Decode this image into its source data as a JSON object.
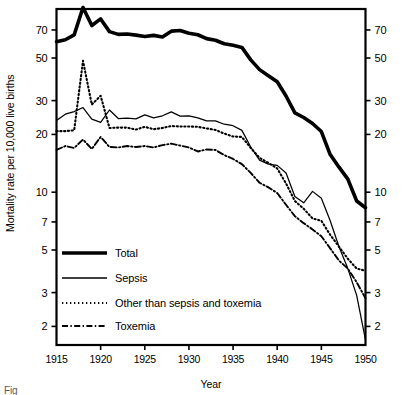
{
  "chart_data": {
    "type": "line",
    "title": "",
    "xlabel": "Year",
    "ylabel": "Mortality rate per 10,000 live births",
    "yscale": "log",
    "ylim": [
      1.6,
      90
    ],
    "xlim": [
      1915,
      1950
    ],
    "grid": false,
    "legend_position": "lower-left-inside",
    "ytick_labels": [
      "70",
      "50",
      "30",
      "20",
      "10",
      "7",
      "5",
      "3",
      "2"
    ],
    "ytick_values": [
      70,
      50,
      30,
      20,
      10,
      7,
      5,
      3,
      2
    ],
    "xtick_labels": [
      "1915",
      "1920",
      "1925",
      "1930",
      "1935",
      "1940",
      "1945",
      "1950"
    ],
    "xtick_values": [
      1915,
      1920,
      1925,
      1930,
      1935,
      1940,
      1945,
      1950
    ],
    "right_axis_labels": [
      "70",
      "50",
      "30",
      "20",
      "10",
      "7",
      "5",
      "3",
      "2"
    ],
    "x": [
      1915,
      1916,
      1917,
      1918,
      1919,
      1920,
      1921,
      1922,
      1923,
      1924,
      1925,
      1926,
      1927,
      1928,
      1929,
      1930,
      1931,
      1932,
      1933,
      1934,
      1935,
      1936,
      1937,
      1938,
      1939,
      1940,
      1941,
      1942,
      1943,
      1944,
      1945,
      1946,
      1947,
      1948,
      1949,
      1950
    ],
    "series": [
      {
        "name": "Total",
        "style": "thick-solid",
        "values": [
          60.8,
          62.2,
          66.0,
          91.6,
          73.8,
          79.9,
          68.6,
          66.4,
          66.7,
          65.8,
          64.7,
          65.6,
          64.4,
          69.0,
          69.5,
          67.3,
          66.1,
          63.1,
          61.9,
          59.3,
          58.2,
          56.8,
          48.9,
          43.5,
          40.4,
          37.6,
          31.7,
          25.9,
          24.5,
          22.8,
          20.7,
          15.7,
          13.5,
          11.7,
          9.0,
          8.3
        ]
      },
      {
        "name": "Sepsis",
        "style": "thin-solid",
        "values": [
          23.6,
          25.5,
          26.3,
          27.6,
          24.0,
          23.1,
          26.8,
          24.2,
          24.3,
          24.1,
          25.3,
          24.4,
          25.0,
          26.2,
          24.9,
          25.0,
          24.4,
          23.5,
          23.5,
          22.6,
          22.2,
          21.0,
          17.2,
          14.7,
          14.0,
          13.8,
          12.6,
          9.5,
          8.8,
          10.1,
          9.3,
          7.1,
          5.2,
          4.0,
          2.9,
          1.7
        ]
      },
      {
        "name": "Other than sepsis and toxemia",
        "style": "dotted",
        "values": [
          20.8,
          20.8,
          21.0,
          48.4,
          28.6,
          31.8,
          21.6,
          21.7,
          21.7,
          21.2,
          21.9,
          21.3,
          21.6,
          22.1,
          22.0,
          22.0,
          21.9,
          21.5,
          21.1,
          20.2,
          19.5,
          19.4,
          17.0,
          15.1,
          14.2,
          13.3,
          11.1,
          9.0,
          8.2,
          7.3,
          7.1,
          6.0,
          5.2,
          4.5,
          4.0,
          3.9
        ]
      },
      {
        "name": "Toxemia",
        "style": "dash-dot",
        "values": [
          16.6,
          17.4,
          17.0,
          18.8,
          16.8,
          19.4,
          17.2,
          17.1,
          17.4,
          17.2,
          17.4,
          17.1,
          17.6,
          17.9,
          17.5,
          17.1,
          16.3,
          16.7,
          16.6,
          15.6,
          14.9,
          14.0,
          12.6,
          11.2,
          10.6,
          9.9,
          8.6,
          7.5,
          6.9,
          6.4,
          5.9,
          5.1,
          4.4,
          4.0,
          3.4,
          2.8
        ]
      }
    ]
  },
  "axes": {
    "ylabel": "Mortality rate per 10,000 live births",
    "xlabel": "Year"
  },
  "legend": {
    "items": [
      {
        "label": "Total",
        "style": "thick-solid"
      },
      {
        "label": "Sepsis",
        "style": "thin-solid"
      },
      {
        "label": "Other than sepsis and toxemia",
        "style": "dotted"
      },
      {
        "label": "Toxemia",
        "style": "dash-dot"
      }
    ]
  },
  "caption": {
    "text": "Fig"
  }
}
